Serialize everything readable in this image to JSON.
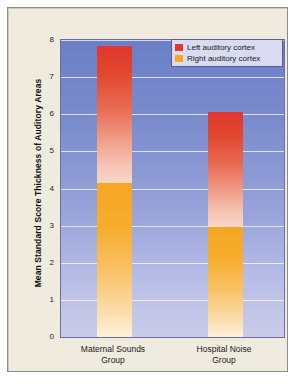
{
  "chart_data": {
    "type": "bar",
    "subtype": "stacked",
    "title": "",
    "xlabel": "",
    "ylabel": "Mean Standard Score Thickness of Auditory Areas",
    "ylim": [
      0,
      8
    ],
    "yticks": [
      8,
      7,
      6,
      5,
      4,
      3,
      2,
      1,
      0
    ],
    "grid": true,
    "legend_position": "top-right",
    "categories": [
      "Maternal Sounds Group",
      "Hospital Noise Group"
    ],
    "category_lines": [
      [
        "Maternal Sounds",
        "Group"
      ],
      [
        "Hospital Noise",
        "Group"
      ]
    ],
    "series": [
      {
        "name": "Right auditory cortex",
        "color": "#f5a623",
        "values": [
          4.15,
          2.95
        ]
      },
      {
        "name": "Left auditory cortex",
        "color": "#e0382f",
        "values": [
          3.7,
          3.1
        ]
      }
    ],
    "totals": [
      7.85,
      6.05
    ],
    "segment_tops": [
      7.85,
      6.05
    ],
    "segment_splits": [
      4.15,
      2.95
    ]
  },
  "legend": {
    "items": [
      {
        "label": "Left auditory cortex",
        "color": "#e0382f"
      },
      {
        "label": "Right auditory cortex",
        "color": "#f5a623"
      }
    ]
  },
  "colors": {
    "panel_background": "#efebdf",
    "plot_top": "#6a7fc6",
    "plot_bottom": "#cacce9",
    "grid": "#ffffff",
    "left_cortex": "#e0382f",
    "right_cortex": "#f5a623",
    "legend_background": "#d9dcf0",
    "border": "#8e8c84"
  }
}
